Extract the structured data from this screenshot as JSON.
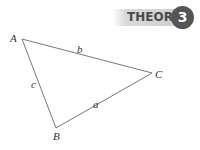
{
  "header": {
    "label": "THEOREM",
    "number": "3",
    "badge_color": "#d0d0d0",
    "number_color": "#555555"
  },
  "diagram": {
    "type": "triangle",
    "vertices": {
      "A": "A",
      "B": "B",
      "C": "C"
    },
    "sides": {
      "a": "a",
      "b": "b",
      "c": "c"
    }
  }
}
